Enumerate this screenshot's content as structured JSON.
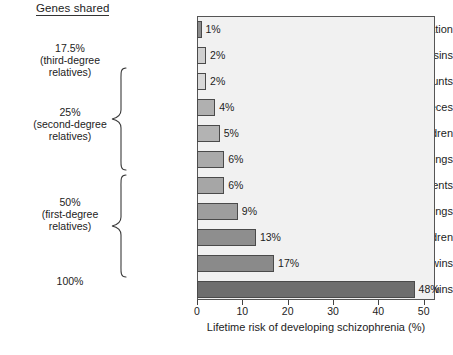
{
  "heading": "Genes shared",
  "chart_data": {
    "type": "bar",
    "orientation": "horizontal",
    "title": "",
    "xlabel": "Lifetime risk of developing schizophrenia (%)",
    "ylabel": "",
    "xlim": [
      0,
      52.5
    ],
    "xticks": [
      0,
      10,
      20,
      30,
      40,
      50
    ],
    "xtick_labels": [
      "0",
      "10",
      "20",
      "30",
      "40",
      "50"
    ],
    "grid": false,
    "legend": "none",
    "categories": [
      "General population",
      "First cousins",
      "Uncles, aunts",
      "Nephews, nieces",
      "Grandchildren",
      "Half-siblings",
      "Parents",
      "Siblings",
      "Children",
      "Fraternal twins",
      "Identical twins"
    ],
    "values": [
      1,
      2,
      2,
      4,
      5,
      6,
      6,
      9,
      13,
      17,
      48
    ],
    "value_labels": [
      "1%",
      "2%",
      "2%",
      "4%",
      "5%",
      "6%",
      "6%",
      "9%",
      "13%",
      "17%",
      "48%"
    ],
    "bar_colors": [
      "#8c8c8c",
      "#d0d0d0",
      "#d8d8d8",
      "#b0b0b0",
      "#b3b3b3",
      "#aaaaaa",
      "#a6a6a6",
      "#9e9e9e",
      "#8e8e8e",
      "#8a8a8a",
      "#6e6e6e"
    ],
    "plot_background": "#f1f1f1",
    "frame_color": "#555555"
  },
  "groups": [
    {
      "id": "third-degree",
      "lines": [
        "17.5%",
        "(third-degree",
        "relatives)"
      ],
      "has_brace": false
    },
    {
      "id": "second-degree",
      "lines": [
        "25%",
        "(second-degree",
        "relatives)"
      ],
      "has_brace": true
    },
    {
      "id": "first-degree",
      "lines": [
        "50%",
        "(first-degree",
        "relatives)"
      ],
      "has_brace": true
    },
    {
      "id": "identical",
      "lines": [
        "100%"
      ],
      "has_brace": false
    }
  ]
}
